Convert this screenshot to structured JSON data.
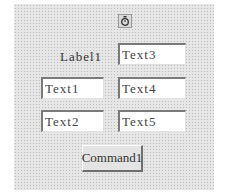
{
  "form": {
    "timer_icon": "stopwatch-icon",
    "label1": "Label1",
    "textboxes": {
      "text1": "Text1",
      "text2": "Text2",
      "text3": "Text3",
      "text4": "Text4",
      "text5": "Text5"
    },
    "command1": "Command1"
  },
  "colors": {
    "form_bg": "#e6e6e6",
    "textbox_bg": "#ffffff",
    "button_bg": "#e4e4e4"
  }
}
